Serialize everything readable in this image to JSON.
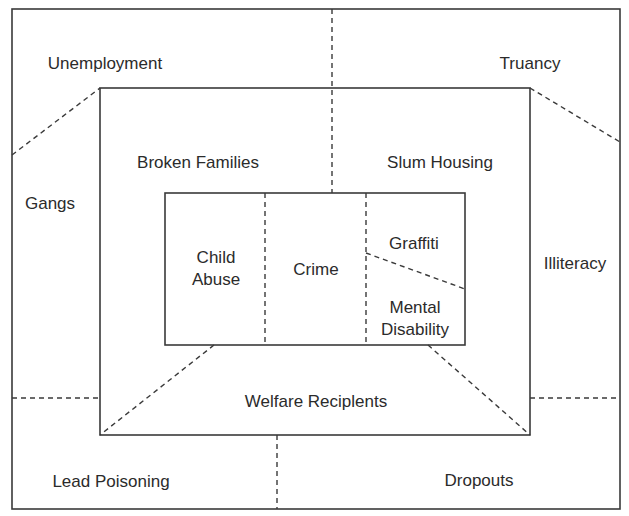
{
  "diagram": {
    "outer_ring": {
      "labels": {
        "top_left": "Unemployment",
        "top_right": "Truancy",
        "left": "Gangs",
        "right": "Illiteracy",
        "bottom_left": "Lead Poisoning",
        "bottom_right": "Dropouts"
      }
    },
    "middle_ring": {
      "labels": {
        "top_left": "Broken Families",
        "top_right": "Slum Housing",
        "bottom": "Welfare Reciplents"
      }
    },
    "inner_box": {
      "cells": {
        "left": "Child\nAbuse",
        "center": "Crime",
        "right_top": "Graffiti",
        "right_bottom": "Mental\nDisability"
      }
    },
    "colors": {
      "line": "#3a3a3a",
      "text": "#2b2b2b",
      "background": "#ffffff"
    }
  }
}
